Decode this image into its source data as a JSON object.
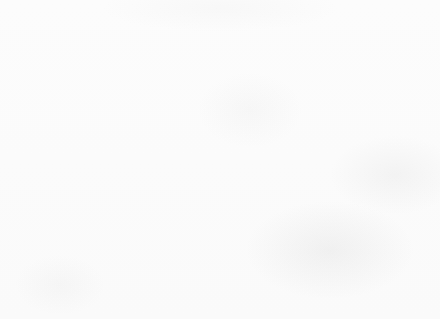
{
  "chart_data": {
    "type": "bar",
    "title": "",
    "subtitle": "",
    "xlabel": "Method of delivery",
    "ylabel": "Relative Frequency",
    "categories": [
      "Spontaneous vertex",
      "Caesarean emergency",
      "Caesarean elective",
      "Ventouse",
      "Forceps other",
      "Forceps low",
      "Breech other",
      "Spontaneous other"
    ],
    "values": [
      58.5,
      15.8,
      12.2,
      5.5,
      3.6,
      3.0,
      0.4,
      0.2
    ],
    "value_labels": [
      "58.5%",
      "15.8%",
      "12.2%",
      "5.5%",
      "3.6%",
      "3.0%",
      "0.4%",
      "0.2%"
    ],
    "ylim": [
      0,
      70
    ],
    "ytick_labels": [
      "0%",
      "10%",
      "20%",
      "30%",
      "40%",
      "50%",
      "60%",
      "70%"
    ],
    "ytick_values": [
      0,
      10,
      20,
      30,
      40,
      50,
      60,
      70
    ],
    "grid": "horizontal",
    "legend": "none",
    "bar_color": "#7b7b7b",
    "gridline_color": "#dcdcdc",
    "axis_color": "#b9b9b9",
    "background_color": "#fbfbfb",
    "annotations": []
  }
}
